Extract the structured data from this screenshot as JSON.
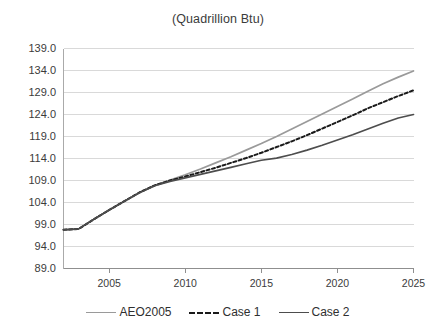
{
  "chart_data": {
    "type": "line",
    "title": "(Quadrillion Btu)",
    "xlabel": "",
    "ylabel": "",
    "xlim": [
      2002,
      2025
    ],
    "ylim": [
      89.0,
      139.0
    ],
    "grid": true,
    "legend_position": "bottom",
    "yticks": [
      "139.0",
      "134.0",
      "129.0",
      "124.0",
      "119.0",
      "114.0",
      "109.0",
      "104.0",
      "99.0",
      "94.0",
      "89.0"
    ],
    "ytick_values": [
      139.0,
      134.0,
      129.0,
      124.0,
      119.0,
      114.0,
      109.0,
      104.0,
      99.0,
      94.0,
      89.0
    ],
    "xticks": [
      "2005",
      "2010",
      "2015",
      "2020",
      "2025"
    ],
    "xtick_values": [
      2005,
      2010,
      2015,
      2020,
      2025
    ],
    "x": [
      2002,
      2003,
      2004,
      2005,
      2006,
      2007,
      2008,
      2009,
      2010,
      2011,
      2012,
      2013,
      2014,
      2015,
      2016,
      2017,
      2018,
      2019,
      2020,
      2021,
      2022,
      2023,
      2024,
      2025
    ],
    "series": [
      {
        "name": "AEO2005",
        "color": "#9a9a9a",
        "style": "solid",
        "values": [
          97.8,
          98.0,
          100.2,
          102.3,
          104.3,
          106.3,
          107.9,
          109.1,
          110.3,
          111.6,
          113.0,
          114.4,
          115.9,
          117.4,
          119.0,
          120.7,
          122.4,
          124.1,
          125.8,
          127.5,
          129.3,
          131.0,
          132.5,
          133.9
        ]
      },
      {
        "name": "Case 1",
        "color": "#1a1a1a",
        "style": "dashed",
        "values": [
          97.8,
          98.0,
          100.2,
          102.3,
          104.3,
          106.3,
          107.9,
          109.0,
          109.9,
          110.9,
          111.9,
          113.0,
          114.1,
          115.3,
          116.6,
          117.9,
          119.3,
          120.8,
          122.3,
          123.8,
          125.4,
          126.8,
          128.2,
          129.5
        ]
      },
      {
        "name": "Case 2",
        "color": "#4d4d4d",
        "style": "solid",
        "values": [
          97.8,
          98.0,
          100.2,
          102.3,
          104.3,
          106.2,
          107.8,
          108.8,
          109.6,
          110.4,
          111.2,
          112.0,
          112.8,
          113.6,
          114.1,
          114.9,
          115.9,
          117.0,
          118.2,
          119.4,
          120.7,
          122.0,
          123.2,
          124.0
        ]
      }
    ]
  },
  "legend": {
    "items": [
      {
        "label": "AEO2005"
      },
      {
        "label": "Case 1"
      },
      {
        "label": "Case 2"
      }
    ]
  }
}
